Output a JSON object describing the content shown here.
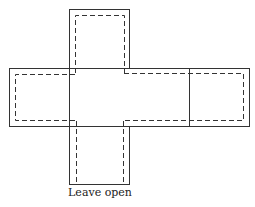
{
  "diagram": {
    "label": "Leave open",
    "colors": {
      "stroke": "#333333",
      "background": "#ffffff"
    }
  }
}
